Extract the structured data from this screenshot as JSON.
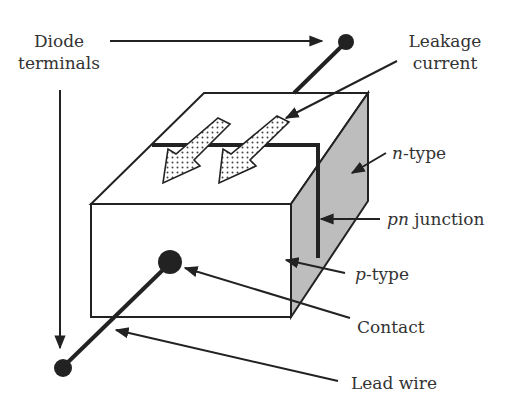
{
  "diagram": {
    "colors": {
      "line": "#222222",
      "shade": "#bdbdbd",
      "text": "#333333",
      "background": "#ffffff"
    },
    "labels": {
      "diode_terminals_1": "Diode",
      "diode_terminals_2": "terminals",
      "leakage_1": "Leakage",
      "leakage_2": "current",
      "n_type_italic": "n",
      "n_type_rest": "-type",
      "pn_italic": "pn",
      "pn_rest": " junction",
      "p_type_italic": "p",
      "p_type_rest": "-type",
      "contact": "Contact",
      "lead_wire": "Lead wire"
    }
  }
}
